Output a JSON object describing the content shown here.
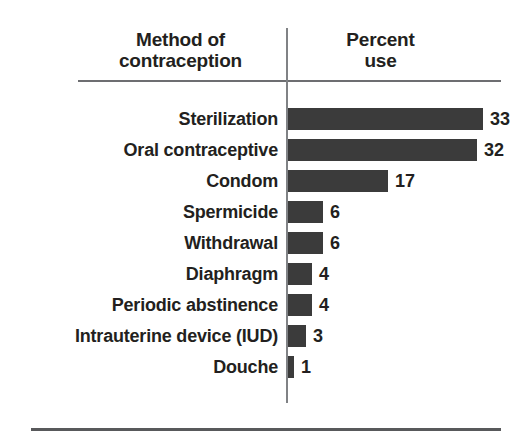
{
  "chart_data": {
    "type": "bar",
    "orientation": "horizontal",
    "title": "",
    "xlabel": "Percent use",
    "ylabel": "Method of contraception",
    "categories": [
      "Sterilization",
      "Oral contraceptive",
      "Condom",
      "Spermicide",
      "Withdrawal",
      "Diaphragm",
      "Periodic abstinence",
      "Intrauterine device (IUD)",
      "Douche"
    ],
    "values": [
      33,
      32,
      17,
      6,
      6,
      4,
      4,
      3,
      1
    ],
    "value_labels": [
      "33",
      "32",
      "17",
      "6",
      "6",
      "4",
      "4",
      "3",
      "1"
    ],
    "xlim": [
      0,
      33
    ],
    "grid": false,
    "legend": null,
    "bar_color": "#3b3b3b"
  },
  "header": {
    "method_label": "Method of\ncontraception",
    "method_line1": "Method of",
    "method_line2": "contraception",
    "percent_line1": "Percent",
    "percent_line2": "use"
  },
  "rows": [
    {
      "label": "Sterilization",
      "value": 33,
      "value_label": "33"
    },
    {
      "label": "Oral contraceptive",
      "value": 32,
      "value_label": "32"
    },
    {
      "label": "Condom",
      "value": 17,
      "value_label": "17"
    },
    {
      "label": "Spermicide",
      "value": 6,
      "value_label": "6"
    },
    {
      "label": "Withdrawal",
      "value": 6,
      "value_label": "6"
    },
    {
      "label": "Diaphragm",
      "value": 4,
      "value_label": "4"
    },
    {
      "label": "Periodic abstinence",
      "value": 4,
      "value_label": "4"
    },
    {
      "label": "Intrauterine device (IUD)",
      "value": 3,
      "value_label": "3"
    },
    {
      "label": "Douche",
      "value": 1,
      "value_label": "1"
    }
  ],
  "style": {
    "bar_color": "#3b3b3b",
    "rule_color": "#6d6e71",
    "text_color": "#231f20",
    "background": "#ffffff",
    "px_per_unit": 5.9
  }
}
